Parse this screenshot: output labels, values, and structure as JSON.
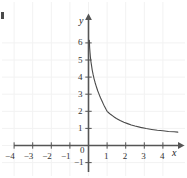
{
  "figure": {
    "background_color": "#ffffff",
    "axis_color": "#555555",
    "curve_color": "#4a4a4a",
    "grid_color": "#f2f2f2",
    "label_color": "#333333",
    "x_axis_name": "x",
    "y_axis_name": "y",
    "origin_label": "0",
    "edge_artifact": ""
  },
  "chart_data": {
    "type": "line",
    "title": "",
    "subtitle": "",
    "xlabel": "x",
    "ylabel": "y",
    "grid": true,
    "legend": null,
    "xlim": [
      -4.7,
      4.8
    ],
    "ylim": [
      -1.4,
      6.8
    ],
    "xticks": [
      -4,
      -3,
      -2,
      -1,
      0,
      1,
      2,
      3,
      4
    ],
    "yticks": [
      -1,
      0,
      1,
      2,
      3,
      4,
      5,
      6
    ],
    "xtick_labels": [
      "-4",
      "-3",
      "-2",
      "-1",
      "0",
      "1",
      "2",
      "3",
      "4"
    ],
    "ytick_labels": [
      "-1",
      "0",
      "1",
      "2",
      "3",
      "4",
      "5",
      "6"
    ],
    "annotations": [],
    "series": [
      {
        "name": "f(x) = x - ln(x) - 1",
        "domain": [
          0.02,
          4.8
        ],
        "asymptote_x": 0,
        "minimum": [
          1,
          0
        ],
        "x": [
          0.045,
          0.06,
          0.08,
          0.1,
          0.13,
          0.16,
          0.2,
          0.25,
          0.3,
          0.35,
          0.4,
          0.45,
          0.5,
          0.55,
          0.6,
          0.65,
          0.7,
          0.75,
          0.8,
          0.85,
          0.9,
          0.95,
          1.0,
          1.1,
          1.2,
          1.3,
          1.4,
          1.5,
          1.7,
          1.9,
          2.1,
          2.3,
          2.5,
          2.8,
          3.1,
          3.4,
          3.7,
          4.0,
          4.3,
          4.6,
          4.8
        ],
        "y": [
          6.15,
          5.75,
          5.45,
          5.2,
          4.91,
          4.7,
          4.41,
          4.14,
          3.9,
          3.7,
          3.52,
          3.35,
          3.19,
          3.05,
          2.91,
          2.78,
          2.66,
          2.54,
          2.42,
          2.31,
          2.21,
          2.1,
          2.0,
          1.9,
          1.81,
          1.73,
          1.65,
          1.58,
          1.46,
          1.36,
          1.28,
          1.2,
          1.14,
          1.06,
          0.99,
          0.94,
          0.89,
          0.86,
          0.82,
          0.8,
          0.78
        ],
        "note": "steep decay from vertical asymptote at x=0 to a minimum touching the x-axis at x=1, then slow logarithmic-like rise to about y=1.6 at x=4.5"
      }
    ]
  },
  "tick_labels_x": [
    {
      "text": "-4",
      "value": -4
    },
    {
      "text": "-3",
      "value": -3
    },
    {
      "text": "-2",
      "value": -2
    },
    {
      "text": "-1",
      "value": -1
    },
    {
      "text": "1",
      "value": 1
    },
    {
      "text": "2",
      "value": 2
    },
    {
      "text": "3",
      "value": 3
    },
    {
      "text": "4",
      "value": 4
    }
  ],
  "tick_labels_y": [
    {
      "text": "6",
      "value": 6
    },
    {
      "text": "5",
      "value": 5
    },
    {
      "text": "4",
      "value": 4
    },
    {
      "text": "3",
      "value": 3
    },
    {
      "text": "2",
      "value": 2
    },
    {
      "text": "1",
      "value": 1
    },
    {
      "text": "-1",
      "value": -1
    }
  ]
}
